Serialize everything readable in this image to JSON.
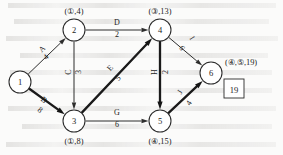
{
  "figure": {
    "answer_box": "19"
  },
  "nodes": [
    {
      "id": "1",
      "num": "1",
      "cx": 20,
      "cy": 82,
      "r": 11,
      "label": "",
      "label_x": 20,
      "label_y": 82,
      "label_anchor": "middle"
    },
    {
      "id": "2",
      "num": "2",
      "cx": 74,
      "cy": 30,
      "r": 11,
      "label": "(①,4)",
      "label_x": 74,
      "label_y": 11,
      "label_anchor": "middle"
    },
    {
      "id": "3",
      "num": "3",
      "cx": 74,
      "cy": 121,
      "r": 11,
      "label": "(①,8)",
      "label_x": 74,
      "label_y": 141,
      "label_anchor": "middle"
    },
    {
      "id": "4",
      "num": "4",
      "cx": 160,
      "cy": 30,
      "r": 11,
      "label": "(③,13)",
      "label_x": 160,
      "label_y": 11,
      "label_anchor": "middle"
    },
    {
      "id": "5",
      "num": "5",
      "cx": 160,
      "cy": 121,
      "r": 11,
      "label": "(④,15)",
      "label_x": 160,
      "label_y": 141,
      "label_anchor": "middle"
    },
    {
      "id": "6",
      "num": "6",
      "cx": 211,
      "cy": 73,
      "r": 11,
      "label": "(④,⑤,19)",
      "label_x": 225,
      "label_y": 62,
      "label_anchor": "start"
    }
  ],
  "edges": [
    {
      "id": "A",
      "name": "A",
      "weight": "4",
      "from": "1",
      "to": "2",
      "bold": false,
      "label_x": 42,
      "label_y": 49,
      "weight_x": 46,
      "weight_y": 57,
      "rotate": -44
    },
    {
      "id": "B",
      "name": "B",
      "weight": "8",
      "from": "1",
      "to": "3",
      "bold": true,
      "label_x": 44,
      "label_y": 100,
      "weight_x": 40,
      "weight_y": 110,
      "rotate": 38
    },
    {
      "id": "C",
      "name": "C",
      "weight": "3",
      "from": "2",
      "to": "3",
      "bold": false,
      "label_x": 68,
      "label_y": 72,
      "weight_x": 78,
      "weight_y": 72,
      "rotate": -90
    },
    {
      "id": "D",
      "name": "D",
      "weight": "2",
      "from": "2",
      "to": "4",
      "bold": false,
      "label_x": 117,
      "label_y": 22,
      "weight_x": 117,
      "weight_y": 34,
      "rotate": 0
    },
    {
      "id": "E",
      "name": "E",
      "weight": "5",
      "from": "3",
      "to": "4",
      "bold": true,
      "label_x": 110,
      "label_y": 68,
      "weight_x": 118,
      "weight_y": 78,
      "rotate": -47
    },
    {
      "id": "G",
      "name": "G",
      "weight": "6",
      "from": "3",
      "to": "5",
      "bold": false,
      "label_x": 117,
      "label_y": 112,
      "weight_x": 117,
      "weight_y": 124,
      "rotate": 0
    },
    {
      "id": "H",
      "name": "H",
      "weight": "2",
      "from": "4",
      "to": "5",
      "bold": true,
      "label_x": 154,
      "label_y": 72,
      "weight_x": 165,
      "weight_y": 72,
      "rotate": -90
    },
    {
      "id": "I",
      "name": "I",
      "weight": "6",
      "from": "4",
      "to": "6",
      "bold": false,
      "label_x": 192,
      "label_y": 38,
      "weight_x": 182,
      "weight_y": 48,
      "rotate": 58
    },
    {
      "id": "J",
      "name": "J",
      "weight": "4",
      "from": "5",
      "to": "6",
      "bold": true,
      "label_x": 180,
      "label_y": 92,
      "weight_x": 189,
      "weight_y": 103,
      "rotate": -58
    }
  ],
  "geometry": {
    "ghost_lines": [
      {
        "x": 8,
        "y": 3,
        "w": 268
      },
      {
        "x": 14,
        "y": 19,
        "w": 255
      },
      {
        "x": 6,
        "y": 36,
        "w": 272
      },
      {
        "x": 20,
        "y": 53,
        "w": 248
      },
      {
        "x": 10,
        "y": 70,
        "w": 262
      },
      {
        "x": 16,
        "y": 88,
        "w": 256
      },
      {
        "x": 8,
        "y": 106,
        "w": 268
      },
      {
        "x": 22,
        "y": 124,
        "w": 250
      },
      {
        "x": 6,
        "y": 142,
        "w": 270
      }
    ]
  }
}
